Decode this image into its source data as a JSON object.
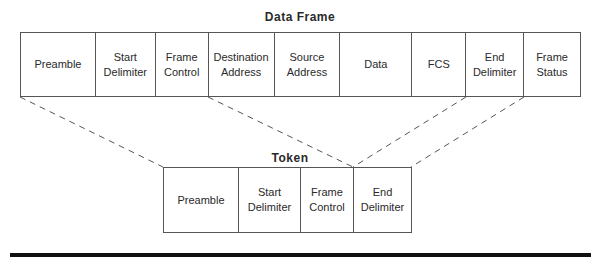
{
  "data_frame": {
    "title": "Data Frame",
    "fields": [
      {
        "label": "Preamble",
        "width": 75
      },
      {
        "label": "Start\nDelimiter",
        "width": 60
      },
      {
        "label": "Frame\nControl",
        "width": 53
      },
      {
        "label": "Destination\nAddress",
        "width": 66
      },
      {
        "label": "Source\nAddress",
        "width": 66
      },
      {
        "label": "Data",
        "width": 72
      },
      {
        "label": "FCS",
        "width": 54
      },
      {
        "label": "End\nDelimiter",
        "width": 58
      },
      {
        "label": "Frame\nStatus",
        "width": 56
      }
    ]
  },
  "token": {
    "title": "Token",
    "fields": [
      {
        "label": "Preamble",
        "width": 75
      },
      {
        "label": "Start\nDelimiter",
        "width": 62
      },
      {
        "label": "Frame\nControl",
        "width": 53
      },
      {
        "label": "End\nDelimiter",
        "width": 58
      }
    ]
  }
}
